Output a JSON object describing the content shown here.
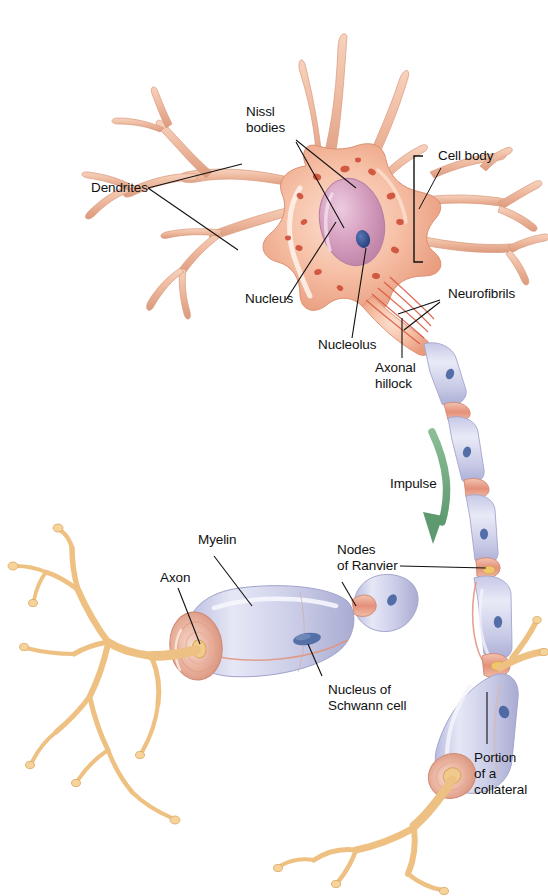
{
  "figure": {
    "background_color": "#ffffff",
    "width": 548,
    "height": 896,
    "faint_caption": ""
  },
  "labels": {
    "nissl_bodies": "Nissl\nbodies",
    "dendrites": "Dendrites",
    "cell_body": "Cell body",
    "nucleus": "Nucleus",
    "nucleolus": "Nucleolus",
    "neurofibrils": "Neurofibrils",
    "axonal_hillock": "Axonal\nhillock",
    "impulse": "Impulse",
    "myelin": "Myelin",
    "axon": "Axon",
    "nodes_of_ranvier": "Nodes\nof Ranvier",
    "nucleus_of_schwann_cell": "Nucleus of\nSchwann cell",
    "portion_of_a_collateral": "Portion\nof a\ncollateral"
  },
  "colors": {
    "soma_fill": "#f4b9a0",
    "soma_light": "#fbdcc9",
    "soma_deep": "#e8886c",
    "nucleus_fill": "#d9a1c0",
    "nucleus_highlight": "#e9c4d8",
    "nucleolus_fill": "#2f4a86",
    "nissl_body": "#d9563c",
    "dendrite_fill": "#f0bca4",
    "dendrite_edge": "#d98f72",
    "myelin_fill": "#cfd0ea",
    "myelin_light": "#e4e4f4",
    "myelin_edge": "#9a9cc4",
    "node_fill": "#e8a893",
    "axon_core": "#f1c98a",
    "terminal_fill": "#f3cf93",
    "terminal_edge": "#d7a758",
    "schwann_nucleus": "#3d5b9b",
    "impulse_arrow": "#6fa87e",
    "leader_line": "#111111",
    "label_text": "#111111"
  },
  "anatomy_parts": [
    {
      "name": "cell-body",
      "label": "Cell body"
    },
    {
      "name": "dendrites",
      "label": "Dendrites"
    },
    {
      "name": "nucleus",
      "label": "Nucleus"
    },
    {
      "name": "nucleolus",
      "label": "Nucleolus"
    },
    {
      "name": "nissl-bodies",
      "label": "Nissl bodies"
    },
    {
      "name": "neurofibrils",
      "label": "Neurofibrils"
    },
    {
      "name": "axonal-hillock",
      "label": "Axonal hillock"
    },
    {
      "name": "myelin-sheath",
      "label": "Myelin"
    },
    {
      "name": "axon",
      "label": "Axon"
    },
    {
      "name": "nodes-of-ranvier",
      "label": "Nodes of Ranvier"
    },
    {
      "name": "schwann-cell-nucleus",
      "label": "Nucleus of Schwann cell"
    },
    {
      "name": "collateral",
      "label": "Portion of a collateral"
    },
    {
      "name": "impulse-direction",
      "label": "Impulse"
    }
  ]
}
